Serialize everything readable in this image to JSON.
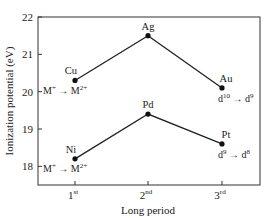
{
  "chart_data": {
    "type": "line",
    "title": "",
    "xlabel": "Long period",
    "ylabel": "Ionization potential (eV)",
    "categories": [
      "1st",
      "2nd",
      "3rd"
    ],
    "category_display": [
      {
        "num": "1",
        "sup": "st"
      },
      {
        "num": "2",
        "sup": "nd"
      },
      {
        "num": "3",
        "sup": "rd"
      }
    ],
    "ylim": [
      17.5,
      22
    ],
    "yticks": [
      18,
      19,
      20,
      21,
      22
    ],
    "grid": false,
    "legend": null,
    "series": [
      {
        "name": "M+ → M2+ (Cu, Ag, Au)",
        "labels": [
          "Cu",
          "Ag",
          "Au"
        ],
        "values": [
          20.3,
          21.5,
          20.1
        ]
      },
      {
        "name": "M+ → M2+ (Ni, Pd, Pt)",
        "labels": [
          "Ni",
          "Pd",
          "Pt"
        ],
        "values": [
          18.2,
          19.4,
          18.6
        ]
      }
    ],
    "annotations": [
      {
        "text": "M+ → M2+",
        "near": "Cu",
        "parts": {
          "a": "M",
          "a_sup": "+",
          "arrow": "→",
          "b": "M",
          "b_sup": "2+"
        }
      },
      {
        "text": "M+ → M2+",
        "near": "Ni",
        "parts": {
          "a": "M",
          "a_sup": "+",
          "arrow": "→",
          "b": "M",
          "b_sup": "2+"
        }
      },
      {
        "text": "d10 → d9",
        "near": "Au",
        "parts": {
          "a": "d",
          "a_sup": "10",
          "arrow": "→",
          "b": "d",
          "b_sup": "9"
        }
      },
      {
        "text": "d9 → d8",
        "near": "Pt",
        "parts": {
          "a": "d",
          "a_sup": "9",
          "arrow": "→",
          "b": "d",
          "b_sup": "8"
        }
      }
    ]
  }
}
